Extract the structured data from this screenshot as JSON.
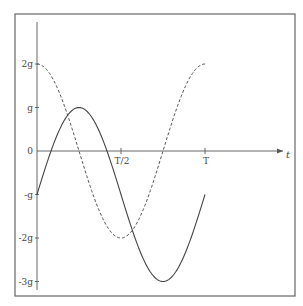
{
  "chart_data": {
    "type": "line",
    "title": "",
    "xlabel": "t",
    "ylabel": "",
    "x_ticks": [
      {
        "label": "T/2",
        "value": 0.5
      },
      {
        "label": "T",
        "value": 1.0
      }
    ],
    "y_ticks": [
      {
        "label": "2g",
        "value": 2
      },
      {
        "label": "g",
        "value": 1
      },
      {
        "label": "0",
        "value": 0
      },
      {
        "label": "-g",
        "value": -1
      },
      {
        "label": "-2g",
        "value": -2
      },
      {
        "label": "-3g",
        "value": -3
      }
    ],
    "xlim": [
      0,
      1
    ],
    "ylim": [
      -3.3,
      2.5
    ],
    "grid": false,
    "legend": null,
    "x": [
      0,
      0.125,
      0.25,
      0.375,
      0.5,
      0.625,
      0.75,
      0.875,
      1.0
    ],
    "series": [
      {
        "name": "solid",
        "style": "solid",
        "formula": "-g + 2g*sin(2*pi*t/T)",
        "values": [
          -1,
          0.414,
          1,
          0.414,
          -1,
          -2.414,
          -3,
          -2.414,
          -1
        ]
      },
      {
        "name": "dashed",
        "style": "dashed",
        "formula": "2g*cos(2*pi*t/T)",
        "values": [
          2,
          1.414,
          0,
          -1.414,
          -2,
          -1.414,
          0,
          1.414,
          2
        ]
      }
    ]
  },
  "colors": {
    "line": "#555555",
    "frame": "#666666",
    "background": "#ffffff"
  }
}
